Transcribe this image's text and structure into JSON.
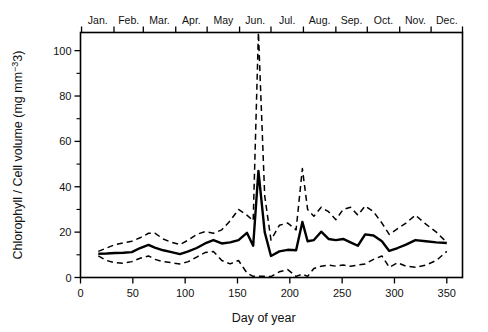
{
  "chart_data": {
    "type": "line",
    "title": "",
    "xlabel": "Day of year",
    "ylabel": "Chlorophyll / Cell volume (mg mm−3)",
    "xlim": [
      0,
      365
    ],
    "ylim": [
      0,
      108
    ],
    "grid": false,
    "legend": "none",
    "xticks": [
      0,
      50,
      100,
      150,
      200,
      250,
      300,
      350
    ],
    "xtick_labels": [
      "0",
      "50",
      "100",
      "150",
      "200",
      "250",
      "300",
      "350"
    ],
    "yticks": [
      0,
      20,
      40,
      60,
      80,
      100
    ],
    "ytick_labels": [
      "0",
      "20",
      "40",
      "60",
      "80",
      "100"
    ],
    "yticks_minor": [
      10,
      30,
      50,
      70,
      90
    ],
    "top_axis_label": "month",
    "month_labels": [
      "Jan.",
      "Feb.",
      "Mar.",
      "Apr.",
      "May",
      "Jun.",
      "Jul.",
      "Aug.",
      "Sep.",
      "Oct.",
      "Nov.",
      "Dec."
    ],
    "month_boundaries": [
      1,
      32,
      60,
      91,
      121,
      152,
      182,
      213,
      244,
      274,
      305,
      335,
      365
    ],
    "series": [
      {
        "name": "mean",
        "style": "solid",
        "color": "#000000",
        "x": [
          17,
          25,
          33,
          41,
          49,
          57,
          65,
          71,
          79,
          87,
          95,
          103,
          111,
          119,
          127,
          135,
          143,
          151,
          159,
          165,
          170,
          176,
          182,
          190,
          198,
          206,
          212,
          217,
          223,
          230,
          237,
          244,
          251,
          258,
          265,
          272,
          280,
          288,
          295,
          303,
          311,
          320,
          330,
          340,
          350
        ],
        "values": [
          10.5,
          10.6,
          10.8,
          10.9,
          11.2,
          13.0,
          14.4,
          13.2,
          12.0,
          11.2,
          10.3,
          11.5,
          13.0,
          15.0,
          16.5,
          15.0,
          15.5,
          16.5,
          19.7,
          14.0,
          47.0,
          20.0,
          9.5,
          11.5,
          12.2,
          12.0,
          24.5,
          16.0,
          16.5,
          20.2,
          17.0,
          16.5,
          17.0,
          15.5,
          14.0,
          19.0,
          18.5,
          16.0,
          11.7,
          13.0,
          14.5,
          16.5,
          16.0,
          15.5,
          15.2
        ]
      },
      {
        "name": "upper-bound",
        "style": "dashed",
        "color": "#000000",
        "x": [
          17,
          25,
          33,
          41,
          49,
          57,
          65,
          71,
          79,
          87,
          95,
          103,
          111,
          119,
          127,
          135,
          143,
          151,
          159,
          165,
          170,
          176,
          182,
          190,
          198,
          206,
          212,
          217,
          223,
          230,
          237,
          244,
          251,
          258,
          265,
          272,
          280,
          288,
          295,
          303,
          311,
          320,
          330,
          340,
          350
        ],
        "values": [
          11.5,
          13.0,
          14.5,
          15.3,
          16.0,
          17.5,
          19.5,
          19.6,
          17.0,
          15.5,
          14.5,
          16.5,
          19.0,
          20.2,
          19.5,
          21.0,
          25.0,
          30.0,
          27.5,
          25.0,
          108.0,
          36.0,
          16.5,
          23.0,
          24.0,
          21.0,
          48.0,
          30.0,
          27.0,
          31.0,
          29.0,
          25.5,
          30.0,
          31.0,
          27.5,
          31.5,
          29.0,
          24.0,
          19.0,
          21.5,
          24.0,
          27.5,
          23.5,
          20.0,
          15.5
        ]
      },
      {
        "name": "lower-bound",
        "style": "dashed",
        "color": "#000000",
        "x": [
          17,
          25,
          33,
          41,
          49,
          57,
          65,
          71,
          79,
          87,
          95,
          103,
          111,
          119,
          127,
          135,
          143,
          151,
          159,
          165,
          170,
          176,
          182,
          190,
          198,
          206,
          212,
          217,
          223,
          230,
          237,
          244,
          251,
          258,
          265,
          272,
          280,
          288,
          295,
          303,
          311,
          320,
          330,
          340,
          350
        ],
        "values": [
          9.5,
          7.5,
          6.5,
          6.3,
          7.0,
          8.5,
          9.5,
          8.0,
          7.0,
          6.5,
          6.0,
          7.0,
          9.0,
          11.0,
          11.5,
          7.5,
          6.0,
          7.5,
          2.0,
          0.5,
          0.5,
          0.5,
          0.4,
          2.5,
          3.5,
          0.5,
          1.5,
          0.5,
          4.0,
          5.0,
          5.5,
          5.0,
          5.5,
          5.0,
          5.5,
          6.0,
          8.0,
          9.5,
          4.5,
          6.5,
          5.0,
          4.5,
          5.5,
          7.5,
          11.5
        ]
      }
    ],
    "notes": {
      "peak_annotation": "Main spike at day ~170 (June): mean 47, upper bound exceeds axis maximum",
      "secondary_peak": "Secondary spike at day ~212 (August): mean 24.5, upper bound 48"
    }
  },
  "figure": {
    "xlabel": "Day of year",
    "ylabel": "Chlorophyll / Cell volume (mg mm−3)",
    "background": "#ffffff",
    "line_color": "#000000"
  }
}
